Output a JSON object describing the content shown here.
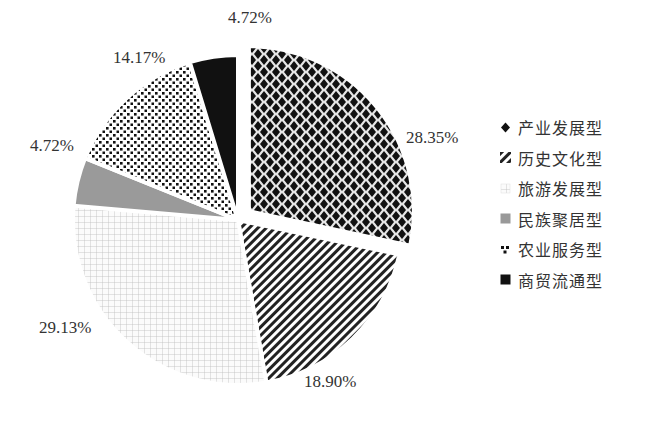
{
  "chart_data": {
    "type": "pie",
    "title": "",
    "categories": [
      "产业发展型",
      "历史文化型",
      "旅游发展型",
      "民族聚居型",
      "农业服务型",
      "商贸流通型"
    ],
    "values": [
      28.35,
      18.9,
      29.13,
      4.72,
      14.17,
      4.72
    ],
    "value_labels": [
      "28.35%",
      "18.90%",
      "29.13%",
      "4.72%",
      "14.17%",
      "4.72%"
    ],
    "patterns": [
      "diamond-checker",
      "diagonal-stripes",
      "light-grid",
      "solid-gray",
      "dots",
      "solid-black"
    ],
    "exploded": [
      "产业发展型"
    ],
    "start_angle_deg": 0,
    "direction": "clockwise",
    "legend_position": "right"
  },
  "labels": {
    "l0": "28.35%",
    "l1": "18.90%",
    "l2": "29.13%",
    "l3": "4.72%",
    "l4": "14.17%",
    "l5": "4.72%"
  },
  "legend": [
    {
      "label": "产业发展型",
      "icon": "diamond-pattern-icon"
    },
    {
      "label": "历史文化型",
      "icon": "stripe-pattern-icon"
    },
    {
      "label": "旅游发展型",
      "icon": "grid-pattern-icon"
    },
    {
      "label": "民族聚居型",
      "icon": "gray-square-icon"
    },
    {
      "label": "农业服务型",
      "icon": "dot-pattern-icon"
    },
    {
      "label": "商贸流通型",
      "icon": "black-square-icon"
    }
  ]
}
